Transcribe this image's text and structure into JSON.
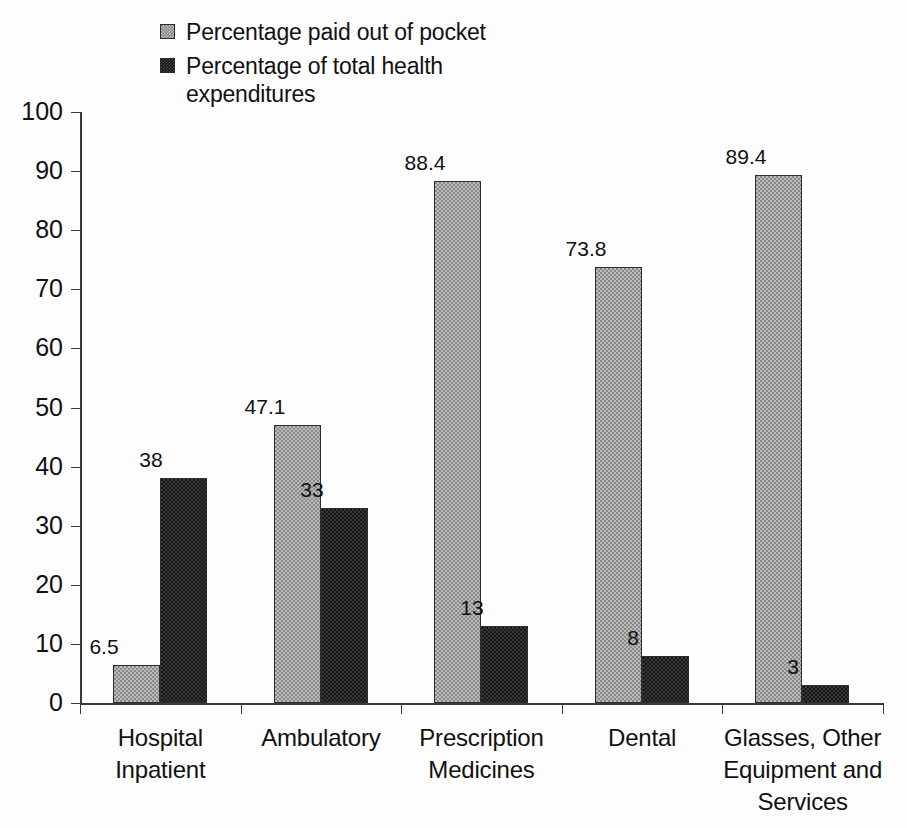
{
  "chart_data": {
    "type": "bar",
    "title": "",
    "xlabel": "",
    "ylabel": "",
    "ylim": [
      0,
      100
    ],
    "ytick_step": 10,
    "ytick_labels": [
      "100",
      "90",
      "80",
      "70",
      "60",
      "50",
      "40",
      "30",
      "20",
      "10",
      "0"
    ],
    "grid": false,
    "legend_position": "top-left",
    "categories": [
      "Hospital Inpatient",
      "Ambulatory",
      "Prescription Medicines",
      "Dental",
      "Glasses, Other Equipment and Services"
    ],
    "category_lines": [
      [
        "Hospital",
        "Inpatient"
      ],
      [
        "Ambulatory"
      ],
      [
        "Prescription",
        "Medicines"
      ],
      [
        "Dental"
      ],
      [
        "Glasses, Other",
        "Equipment and",
        "Services"
      ]
    ],
    "series": [
      {
        "name": "Percentage paid out of pocket",
        "color": "#8a8a8a",
        "values": [
          6.5,
          47.1,
          88.4,
          73.8,
          89.4
        ],
        "labels": [
          "6.5",
          "47.1",
          "88.4",
          "73.8",
          "89.4"
        ]
      },
      {
        "name": "Percentage of total health expenditures",
        "color": "#171717",
        "values": [
          38,
          33,
          13,
          8,
          3
        ],
        "labels": [
          "38",
          "33",
          "13",
          "8",
          "3"
        ]
      }
    ]
  },
  "legend": {
    "items": [
      {
        "label": "Percentage paid out of pocket",
        "swatch": "series-a-swatch"
      },
      {
        "label": "Percentage of total health expenditures",
        "swatch": "series-b-swatch"
      }
    ]
  }
}
